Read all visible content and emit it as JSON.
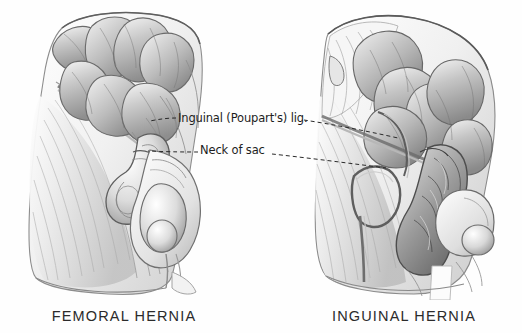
{
  "figure": {
    "medium": "grayscale anatomical pencil and wash illustration",
    "background_color": "#fefefe",
    "ink_color": "#1d1d1d",
    "caption_color": "#2b2b2b"
  },
  "panels": [
    {
      "id": "femoral",
      "caption": "FEMORAL HERNIA",
      "side": "left",
      "description": "Dissection of right groin with coils of small intestine above the inguinal ligament and a hernia sac passing below the ligament into the femoral canal, medial to the spermatic cord and testis."
    },
    {
      "id": "inguinal",
      "caption": "INGUINAL HERNIA",
      "side": "right",
      "description": "Dissection of right groin with coils of small intestine descending through the inguinal canal above the inguinal ligament into the scrotum alongside the testis."
    }
  ],
  "labels": [
    {
      "id": "inguinal-ligament",
      "text": "Inguinal (Poupart's) lig.",
      "leader_style": "dashed",
      "points_to": [
        "femoral-panel-inguinal-ligament",
        "inguinal-panel-inguinal-ligament"
      ]
    },
    {
      "id": "neck-of-sac",
      "text": "Neck of sac",
      "leader_style": "dashed",
      "points_to": [
        "femoral-panel-sac-neck",
        "inguinal-panel-sac-neck"
      ]
    }
  ]
}
